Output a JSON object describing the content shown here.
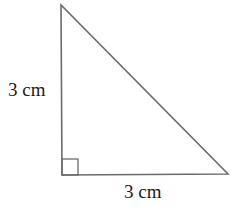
{
  "diagram": {
    "type": "right-triangle",
    "stroke_color": "#6b6b6b",
    "vertices": {
      "top": [
        61,
        5
      ],
      "right_angle": [
        62,
        175
      ],
      "bottom_right": [
        228,
        174
      ]
    },
    "right_angle_marker": true,
    "labels": {
      "left_side": "3 cm",
      "bottom_side": "3 cm"
    }
  }
}
